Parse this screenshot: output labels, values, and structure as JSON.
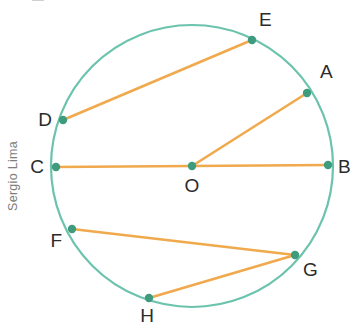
{
  "figure": {
    "colors": {
      "circle_stroke": "#6BC3AD",
      "segment_stroke": "#F0A94C",
      "point_fill": "#3E9B7E",
      "label_text": "#2B2B2B",
      "watermark": "#7D7D7D",
      "background": "#FFFFFF"
    },
    "circle": {
      "center_label": "O",
      "cx": 192,
      "cy": 166,
      "r": 141,
      "stroke_width": 2.2
    },
    "points": [
      {
        "label": "A",
        "x": 307,
        "y": 93,
        "lx": 320,
        "ly": 78,
        "anchor": "start"
      },
      {
        "label": "B",
        "x": 328,
        "y": 165,
        "lx": 338,
        "ly": 173,
        "anchor": "start"
      },
      {
        "label": "C",
        "x": 56,
        "y": 167,
        "lx": 44,
        "ly": 173,
        "anchor": "end"
      },
      {
        "label": "D",
        "x": 63,
        "y": 120,
        "lx": 52,
        "ly": 126,
        "anchor": "end"
      },
      {
        "label": "E",
        "x": 252,
        "y": 40,
        "lx": 259,
        "ly": 26,
        "anchor": "start"
      },
      {
        "label": "F",
        "x": 72,
        "y": 229,
        "lx": 62,
        "ly": 247,
        "anchor": "end"
      },
      {
        "label": "G",
        "x": 295,
        "y": 255,
        "lx": 303,
        "ly": 276,
        "anchor": "start"
      },
      {
        "label": "H",
        "x": 149,
        "y": 298,
        "lx": 147,
        "ly": 322,
        "anchor": "middle"
      },
      {
        "label": "O",
        "x": 192,
        "y": 166,
        "lx": 192,
        "ly": 192,
        "anchor": "middle"
      }
    ],
    "segments": [
      {
        "name": "diameter-CB",
        "from": "C",
        "to": "B",
        "x1": 56,
        "y1": 167,
        "x2": 328,
        "y2": 165
      },
      {
        "name": "radius-OA",
        "from": "O",
        "to": "A",
        "x1": 192,
        "y1": 166,
        "x2": 307,
        "y2": 93
      },
      {
        "name": "chord-DE",
        "from": "D",
        "to": "E",
        "x1": 63,
        "y1": 120,
        "x2": 252,
        "y2": 40
      },
      {
        "name": "chord-FG",
        "from": "F",
        "to": "G",
        "x1": 72,
        "y1": 229,
        "x2": 295,
        "y2": 255
      },
      {
        "name": "chord-HG",
        "from": "H",
        "to": "G",
        "x1": 149,
        "y1": 298,
        "x2": 295,
        "y2": 255
      }
    ],
    "point_radius": 4.2,
    "segment_width": 2.6
  },
  "watermark": {
    "text": "Sergio Lima",
    "x": 17,
    "y": 176
  },
  "chart_data": {
    "type": "diagram",
    "shape": "circle",
    "center": {
      "label": "O",
      "x": 192,
      "y": 166
    },
    "radius": 141,
    "labeled_points": [
      "A",
      "B",
      "C",
      "D",
      "E",
      "F",
      "G",
      "H",
      "O"
    ],
    "on_circle": [
      "A",
      "B",
      "C",
      "D",
      "E",
      "F",
      "G",
      "H"
    ],
    "drawn_segments": [
      "C-B",
      "O-A",
      "D-E",
      "F-G",
      "H-G"
    ],
    "diameters": [
      "C-B"
    ],
    "radii": [
      "O-A",
      "O-C",
      "O-B"
    ],
    "chords": [
      "D-E",
      "F-G",
      "H-G"
    ],
    "grid": false,
    "legend": false
  }
}
